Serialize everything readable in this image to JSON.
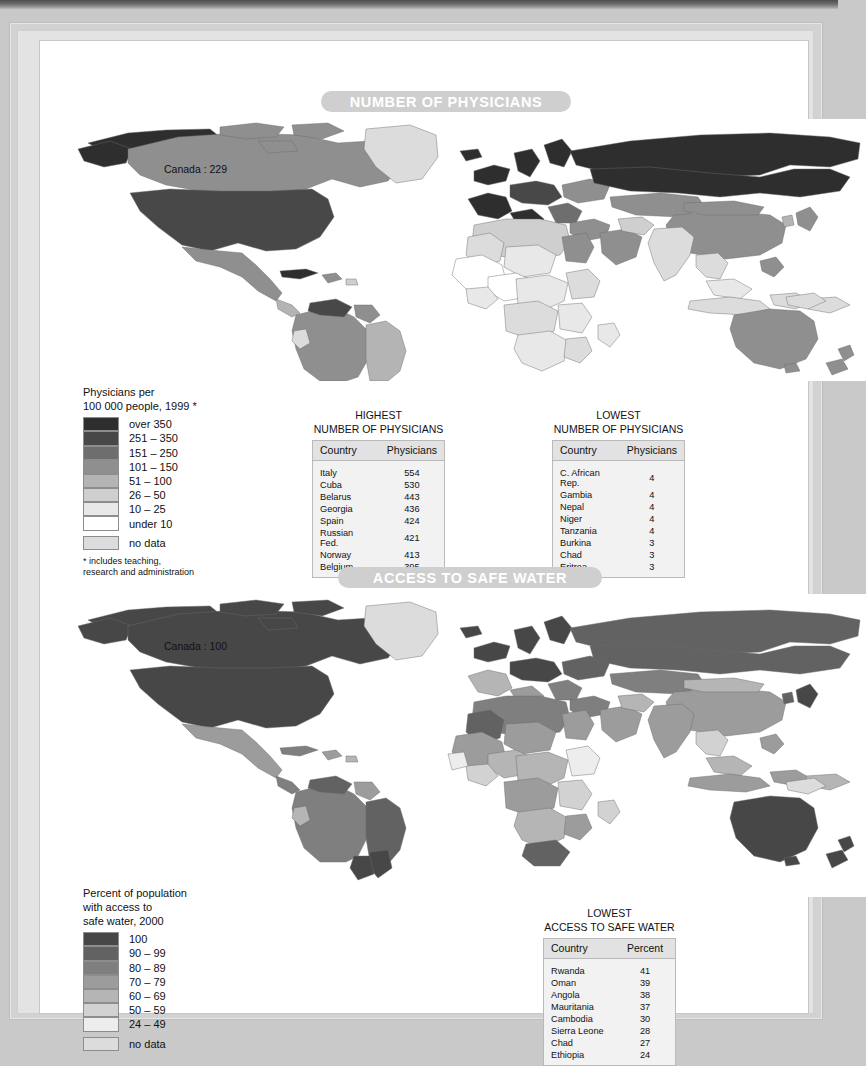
{
  "page": {
    "background": "#c9c9c9",
    "sheet_background": "#ffffff"
  },
  "maps": [
    {
      "id": "physicians",
      "banner_title": "NUMBER OF PHYSICIANS",
      "banner_color": "#cfcfcf",
      "callout_label": "Canada : 229",
      "legend": {
        "title": "Physicians per\n100 000 people, 1999 *",
        "classes": [
          {
            "label": "over 350",
            "color": "#2e2e2e"
          },
          {
            "label": "251 – 350",
            "color": "#484848"
          },
          {
            "label": "151 – 250",
            "color": "#6e6e6e"
          },
          {
            "label": "101 – 150",
            "color": "#8f8f8f"
          },
          {
            "label": "51 – 100",
            "color": "#b4b4b4"
          },
          {
            "label": "26 – 50",
            "color": "#cfcfcf"
          },
          {
            "label": "10 – 25",
            "color": "#e8e8e8"
          },
          {
            "label": "under 10",
            "color": "#ffffff"
          }
        ],
        "nodata": {
          "label": "no data",
          "color": "#dcdcdc"
        },
        "note": "* includes teaching,\nresearch and administration"
      },
      "tables": [
        {
          "id": "highest-physicians",
          "caption": "HIGHEST\nNUMBER OF PHYSICIANS",
          "columns": [
            "Country",
            "Physicians"
          ],
          "rows": [
            [
              "Italy",
              "554"
            ],
            [
              "Cuba",
              "530"
            ],
            [
              "Belarus",
              "443"
            ],
            [
              "Georgia",
              "436"
            ],
            [
              "Spain",
              "424"
            ],
            [
              "Russian Fed.",
              "421"
            ],
            [
              "Norway",
              "413"
            ],
            [
              "Belgium",
              "395"
            ]
          ]
        },
        {
          "id": "lowest-physicians",
          "caption": "LOWEST\nNUMBER OF PHYSICIANS",
          "columns": [
            "Country",
            "Physicians"
          ],
          "rows": [
            [
              "C. African Rep.",
              "4"
            ],
            [
              "Gambia",
              "4"
            ],
            [
              "Nepal",
              "4"
            ],
            [
              "Niger",
              "4"
            ],
            [
              "Tanzania",
              "4"
            ],
            [
              "Burkina",
              "3"
            ],
            [
              "Chad",
              "3"
            ],
            [
              "Eritrea",
              "3"
            ]
          ]
        }
      ]
    },
    {
      "id": "safe-water",
      "banner_title": "ACCESS TO SAFE WATER",
      "banner_color": "#cfcfcf",
      "callout_label": "Canada : 100",
      "legend": {
        "title": "Percent of population\nwith access to\nsafe water, 2000",
        "classes": [
          {
            "label": "100",
            "color": "#474747"
          },
          {
            "label": "90 – 99",
            "color": "#626262"
          },
          {
            "label": "80 – 89",
            "color": "#7f7f7f"
          },
          {
            "label": "70 – 79",
            "color": "#9c9c9c"
          },
          {
            "label": "60 – 69",
            "color": "#b5b5b5"
          },
          {
            "label": "50 – 59",
            "color": "#d2d2d2"
          },
          {
            "label": "24 – 49",
            "color": "#ededed"
          }
        ],
        "nodata": {
          "label": "no data",
          "color": "#dcdcdc"
        },
        "note": ""
      },
      "tables": [
        {
          "id": "lowest-safe-water",
          "caption": "LOWEST\nACCESS TO SAFE WATER",
          "columns": [
            "Country",
            "Percent"
          ],
          "rows": [
            [
              "Rwanda",
              "41"
            ],
            [
              "Oman",
              "39"
            ],
            [
              "Angola",
              "38"
            ],
            [
              "Mauritania",
              "37"
            ],
            [
              "Cambodia",
              "30"
            ],
            [
              "Sierra Leone",
              "28"
            ],
            [
              "Chad",
              "27"
            ],
            [
              "Ethiopia",
              "24"
            ]
          ]
        }
      ]
    }
  ]
}
